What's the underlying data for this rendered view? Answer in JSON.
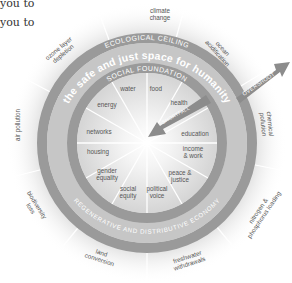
{
  "intro_text": {
    "line1": "you to",
    "line2": "you to"
  },
  "diagram": {
    "title": "the safe and just space for humanity",
    "ecological_ceiling_label": "ECOLOGICAL CEILING",
    "social_foundation_label": "SOCIAL FOUNDATION",
    "economy_label": "REGENERATIVE AND DISTRIBUTIVE ECONOMY",
    "overshoot_label": "OVERSHOOT",
    "shortfall_label": "SHORTFALL",
    "ecological_dimensions": [
      {
        "line1": "climate",
        "line2": "change"
      },
      {
        "line1": "ocean",
        "line2": "acidification"
      },
      {
        "line1": "chemical",
        "line2": "pollution"
      },
      {
        "line1": "nitrogen &",
        "line2": "phosphorus loading"
      },
      {
        "line1": "freshwater",
        "line2": "withdrawals"
      },
      {
        "line1": "land",
        "line2": "conversion"
      },
      {
        "line1": "biodiversity",
        "line2": "loss"
      },
      {
        "line1": "air pollution",
        "line2": ""
      },
      {
        "line1": "ozone layer",
        "line2": "depletion"
      }
    ],
    "social_dimensions": [
      {
        "line1": "water",
        "line2": ""
      },
      {
        "line1": "food",
        "line2": ""
      },
      {
        "line1": "health",
        "line2": ""
      },
      {
        "line1": "education",
        "line2": ""
      },
      {
        "line1": "income",
        "line2": "& work"
      },
      {
        "line1": "peace &",
        "line2": "justice"
      },
      {
        "line1": "political",
        "line2": "voice"
      },
      {
        "line1": "social",
        "line2": "equity"
      },
      {
        "line1": "gender",
        "line2": "equality"
      },
      {
        "line1": "housing",
        "line2": ""
      },
      {
        "line1": "networks",
        "line2": ""
      },
      {
        "line1": "energy",
        "line2": ""
      }
    ],
    "colors": {
      "band": "#9a9a9a",
      "space": "#c4c4c4",
      "core": "#dedede",
      "outer": "#e4e4e4",
      "text": "#555555"
    }
  }
}
